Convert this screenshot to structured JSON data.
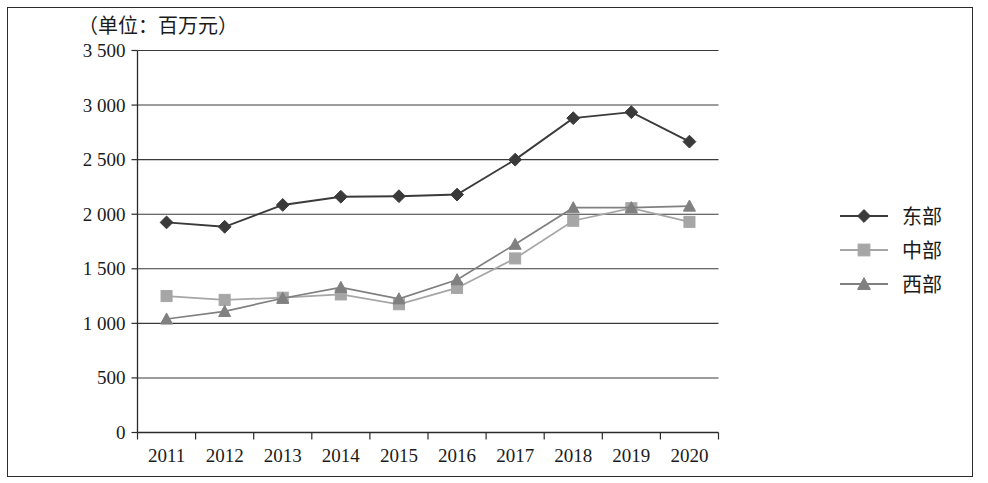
{
  "figure": {
    "unit_label": "（单位：百万元）"
  },
  "chart_data": {
    "type": "line",
    "title": "",
    "subtitle": "",
    "xlabel": "",
    "ylabel": "",
    "unit_note": "（单位：百万元）",
    "categories": [
      "2011",
      "2012",
      "2013",
      "2014",
      "2015",
      "2016",
      "2017",
      "2018",
      "2019",
      "2020"
    ],
    "x": [
      2011,
      2012,
      2013,
      2014,
      2015,
      2016,
      2017,
      2018,
      2019,
      2020
    ],
    "ylim": [
      0,
      3500
    ],
    "yticks": [
      0,
      500,
      1000,
      1500,
      2000,
      2500,
      3000,
      3500
    ],
    "ytick_labels": [
      "0",
      "500",
      "1 000",
      "1 500",
      "2 000",
      "2 500",
      "3 000",
      "3 500"
    ],
    "grid": true,
    "legend_position": "right",
    "series": [
      {
        "name": "东部",
        "marker": "diamond",
        "color": "#3a3a3a",
        "values": [
          1925,
          1885,
          2085,
          2160,
          2165,
          2180,
          2500,
          2880,
          2935,
          2665
        ]
      },
      {
        "name": "中部",
        "marker": "square",
        "color": "#a6a6a6",
        "values": [
          1250,
          1215,
          1235,
          1265,
          1175,
          1325,
          1595,
          1940,
          2055,
          1930
        ]
      },
      {
        "name": "西部",
        "marker": "triangle",
        "color": "#808080",
        "values": [
          1040,
          1110,
          1230,
          1330,
          1225,
          1400,
          1725,
          2060,
          2060,
          2075
        ]
      }
    ]
  },
  "legend": {
    "items": [
      {
        "label": "东部",
        "marker": "diamond",
        "color": "#3a3a3a"
      },
      {
        "label": "中部",
        "marker": "square",
        "color": "#a6a6a6"
      },
      {
        "label": "西部",
        "marker": "triangle",
        "color": "#808080"
      }
    ]
  }
}
